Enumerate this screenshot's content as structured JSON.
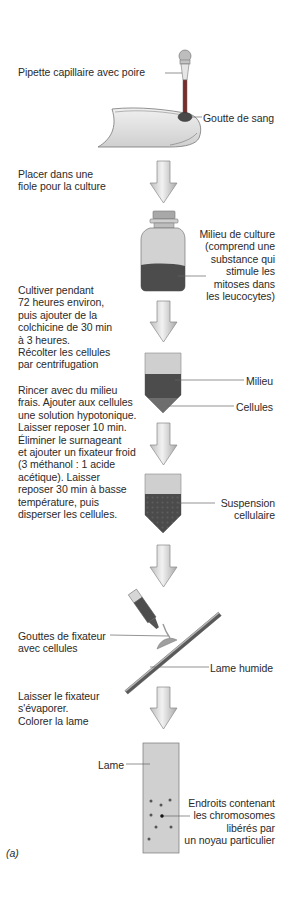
{
  "figure": {
    "caption": "(a)",
    "colors": {
      "dark_fill": "#4a4a4a",
      "medium_fill": "#777777",
      "light_fill": "#c9c9c9",
      "arrow_fill": "#d6d6d6",
      "line": "#555555"
    }
  },
  "steps": [
    {
      "label_left": "",
      "labels_right": [
        "Pipette capillaire avec poire",
        "Goutte de sang"
      ]
    },
    {
      "instruction": "Placer dans une\nfiole pour la culture"
    },
    {
      "label_right": "Milieu de culture\n(comprend une\nsubstance qui\nstimule les\nmitoses dans\nles leucocytes)"
    },
    {
      "instruction": "Cultiver pendant\n72 heures environ,\npuis ajouter de la\ncolchicine de 30 min\nà 3 heures.\nRécolter les cellules\npar centrifugation"
    },
    {
      "labels_right": [
        "Milieu",
        "Cellules"
      ]
    },
    {
      "instruction": "Rincer avec du milieu\nfrais. Ajouter aux cellules\nune solution hypotonique.\nLaisser reposer 10 min.\nÉliminer le surnageant\net ajouter un fixateur froid\n(3 méthanol : 1 acide\nacétique). Laisser\nreposer 30 min à basse\ntempérature, puis\ndisperser les cellules."
    },
    {
      "label_right": "Suspension\ncellulaire"
    },
    {
      "label_left": "Gouttes de fixateur\navec cellules",
      "label_right": "Lame humide"
    },
    {
      "instruction": "Laisser le fixateur\ns'évaporer.\nColorer la lame"
    },
    {
      "label_left": "Lame",
      "label_right": "Endroits contenant\nles chromosomes\nlibérés par\nun noyau particulier"
    }
  ]
}
